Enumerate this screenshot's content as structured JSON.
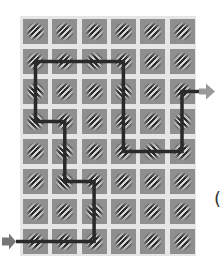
{
  "diagram": {
    "type": "gabor-filter-grid-with-path",
    "grid": {
      "rows": 8,
      "cols": 6,
      "cell_color": "#8f8f8f",
      "gap_color": "#e6e6e6"
    },
    "cells": [
      [
        135,
        135,
        135,
        135,
        135,
        135
      ],
      [
        135,
        135,
        45,
        135,
        135,
        135
      ],
      [
        45,
        135,
        135,
        45,
        135,
        135
      ],
      [
        45,
        135,
        135,
        135,
        135,
        45
      ],
      [
        135,
        45,
        135,
        135,
        45,
        135
      ],
      [
        135,
        45,
        135,
        135,
        135,
        135
      ],
      [
        135,
        135,
        45,
        135,
        135,
        135
      ],
      [
        135,
        135,
        135,
        135,
        135,
        135
      ]
    ],
    "path": {
      "color": "#2a2a2a",
      "cells": [
        [
          7,
          0
        ],
        [
          7,
          2
        ],
        [
          5,
          2
        ],
        [
          5,
          1
        ],
        [
          3,
          1
        ],
        [
          3,
          0
        ],
        [
          1,
          0
        ],
        [
          1,
          3
        ],
        [
          4,
          3
        ],
        [
          4,
          5
        ],
        [
          2,
          5
        ]
      ],
      "entry_arrow": {
        "side": "left",
        "row": 7,
        "color": "#777777"
      },
      "exit_arrow": {
        "side": "right",
        "row": 2,
        "color": "#999999"
      }
    },
    "partial_label": "("
  }
}
